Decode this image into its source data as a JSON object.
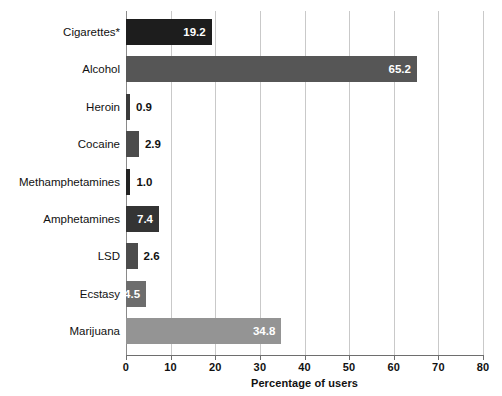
{
  "chart_data": {
    "type": "bar",
    "orientation": "horizontal",
    "title": "",
    "xlabel": "Percentage of users",
    "ylabel": "",
    "xlim": [
      0,
      80
    ],
    "xticks": [
      0,
      10,
      20,
      30,
      40,
      50,
      60,
      70,
      80
    ],
    "xtick_labels": [
      "0",
      "10",
      "20",
      "30",
      "40",
      "50",
      "60",
      "70",
      "80"
    ],
    "grid": "vertical",
    "legend": "none",
    "categories": [
      "Cigarettes*",
      "Alcohol",
      "Heroin",
      "Cocaine",
      "Methamphetamines",
      "Amphetamines",
      "LSD",
      "Ecstasy",
      "Marijuana"
    ],
    "values": [
      19.2,
      65.2,
      0.9,
      2.9,
      1.0,
      7.4,
      2.6,
      4.5,
      34.8
    ],
    "value_labels": [
      "19.2",
      "65.2",
      "0.9",
      "2.9",
      "1.0",
      "7.4",
      "2.6",
      "4.5",
      "34.8"
    ],
    "bar_colors": [
      "#1d1d1d",
      "#565656",
      "#3a3a3a",
      "#4c4c4c",
      "#232323",
      "#343434",
      "#4c4c4c",
      "#6d6d6d",
      "#949494"
    ],
    "label_placement": [
      "inside",
      "inside",
      "outside",
      "outside",
      "outside",
      "inside",
      "outside",
      "inside",
      "inside"
    ]
  },
  "axis": {
    "grid_color": "#c9c9c9",
    "axis_color": "#6e6e6e",
    "text_color": "#111111"
  }
}
